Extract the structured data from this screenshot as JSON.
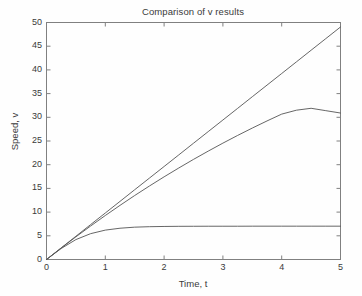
{
  "figure": {
    "background_color": "#fefefe",
    "axes_color": "#808080",
    "text_color": "#3a3a3a",
    "line_color": "#555555"
  },
  "chart_data": {
    "type": "line",
    "title": "Comparison of v results",
    "xlabel": "Time, t",
    "ylabel": "Speed, v",
    "xlim": [
      0,
      5
    ],
    "ylim": [
      0,
      50
    ],
    "grid": false,
    "legend": null,
    "xticks": [
      0,
      1,
      2,
      3,
      4,
      5
    ],
    "xtick_labels": [
      "0",
      "1",
      "2",
      "3",
      "4",
      "5"
    ],
    "yticks": [
      0,
      5,
      10,
      15,
      20,
      25,
      30,
      35,
      40,
      45,
      50
    ],
    "ytick_labels": [
      "0",
      "5",
      "10",
      "15",
      "20",
      "25",
      "30",
      "35",
      "40",
      "45",
      "50"
    ],
    "x": [
      0,
      0.25,
      0.5,
      0.75,
      1,
      1.25,
      1.5,
      1.75,
      2,
      2.25,
      2.5,
      2.75,
      3,
      3.25,
      3.5,
      3.75,
      4,
      4.25,
      4.5,
      4.75,
      5
    ],
    "series": [
      {
        "name": "no drag (linear)",
        "values": [
          0,
          2.45,
          4.9,
          7.36,
          9.81,
          12.26,
          14.72,
          17.17,
          19.62,
          22.07,
          24.53,
          26.98,
          29.43,
          31.88,
          34.34,
          36.79,
          39.24,
          41.69,
          44.15,
          46.6,
          49.05
        ]
      },
      {
        "name": "linear drag (mild)",
        "values": [
          0,
          2.42,
          4.78,
          7.06,
          9.28,
          11.42,
          13.5,
          15.5,
          17.44,
          19.31,
          21.12,
          22.86,
          24.55,
          26.17,
          27.73,
          29.23,
          30.67,
          31.5,
          31.9,
          31.4,
          30.9
        ]
      },
      {
        "name": "quadratic drag (terminal velocity)",
        "values": [
          0,
          2.32,
          4.2,
          5.45,
          6.2,
          6.6,
          6.82,
          6.92,
          6.97,
          7.0,
          7.01,
          7.02,
          7.02,
          7.02,
          7.03,
          7.03,
          7.03,
          7.03,
          7.03,
          7.03,
          7.03
        ]
      }
    ],
    "annotations": []
  }
}
